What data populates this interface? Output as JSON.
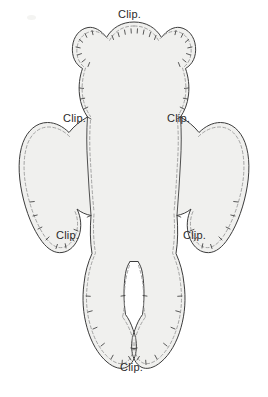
{
  "document": {
    "kind": "sewing-pattern-template",
    "subject": "teddy bear body pattern piece",
    "width_px": 268,
    "height_px": 397
  },
  "colors": {
    "page_background": "#ffffff",
    "piece_fill": "#f0f0ee",
    "cut_line": "#3c3c3c",
    "seam_line": "#9a9a9a",
    "label_text": "#2b2b2b",
    "corner_mark": "#f4f4f2"
  },
  "labels": [
    {
      "id": "clip-head-top",
      "text": "Clip.",
      "x": 118,
      "y": 8,
      "anchor": "head top curve"
    },
    {
      "id": "clip-neck-left",
      "text": "Clip.",
      "x": 63,
      "y": 112,
      "anchor": "left neck inner corner"
    },
    {
      "id": "clip-neck-right",
      "text": "Clip.",
      "x": 167,
      "y": 112,
      "anchor": "right neck inner corner"
    },
    {
      "id": "clip-underarm-left",
      "text": "Clip.",
      "x": 56,
      "y": 229,
      "anchor": "left underarm inner corner"
    },
    {
      "id": "clip-underarm-right",
      "text": "Clip.",
      "x": 183,
      "y": 229,
      "anchor": "right underarm inner corner"
    },
    {
      "id": "clip-crotch-bottom",
      "text": "Clip.",
      "x": 120,
      "y": 361,
      "anchor": "between the feet"
    }
  ],
  "geometry": {
    "cut_line_width": 1.0,
    "seam_line_width": 0.9,
    "seam_dash": "3 2.4",
    "seam_offset_px": 3.5,
    "notch_count_head": 11,
    "notch_count_limbs": 8
  },
  "pattern_paths": {
    "body_outline": "M134,22 C121,22 112,28 106,37 C101,30 94,26 88,27 C79,28 73,36 72,46 C71,56 75,64 82,68 C79,77 78,86 79,95 C80,104 83,111 87,117 C80,121 74,126 69,132 C63,126 55,122 47,122 C36,122 27,130 23,142 C18,156 18,174 22,193 C26,212 33,229 42,241 C48,249 55,253 62,252 C70,251 76,245 79,236 C82,227 81,217 77,209 C81,212 86,214 91,215 C90,228 90,241 92,253 C88,262 85,272 84,283 C82,298 83,313 87,327 C91,342 98,354 107,362 C114,368 121,370 127,367 C132,364 135,358 136,351 C137,344 136,336 133,329 C131,323 128,318 125,314 C123,300 123,286 125,273 C126,268 128,264 130,261 L138,261 C140,264 142,268 143,273 C145,286 145,300 143,314 C140,318 137,323 135,329 C132,336 131,344 132,351 C133,358 136,364 141,367 C147,370 154,368 161,362 C170,354 177,342 181,327 C185,313 186,298 184,283 C183,272 180,262 176,253 C178,241 178,228 177,215 C182,214 187,212 191,209 C187,217 186,227 189,236 C192,245 198,251 206,252 C213,253 220,249 226,241 C235,229 242,212 246,193 C250,174 250,156 245,142 C241,130 232,122 221,122 C213,122 205,126 199,132 C194,126 188,121 181,117 C185,111 188,104 189,95 C190,86 189,77 186,68 C193,64 197,56 196,46 C195,36 189,28 180,27 C174,26 167,30 162,37 C156,28 147,22 134,22 Z",
    "left_arm_inner": "M87,117 C86,131 86,147 87,162 C88,180 89,198 91,215",
    "right_arm_inner": "M181,117 C182,131 182,147 181,162 C180,180 179,198 177,215",
    "crotch_top": "M130,261 L138,261",
    "left_leg_inner": "M130,261 C127,270 125,282 125,295 C125,302 125,308 125,314",
    "right_leg_inner": "M138,261 C141,270 143,282 143,295 C143,302 143,308 143,314"
  }
}
